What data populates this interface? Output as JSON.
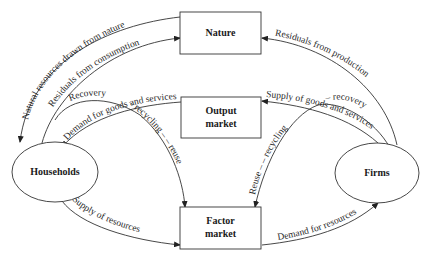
{
  "diagram": {
    "nodes": {
      "nature": {
        "label": "Nature"
      },
      "output_market": {
        "line1": "Output",
        "line2": "market"
      },
      "factor_market": {
        "line1": "Factor",
        "line2": "market"
      },
      "households": {
        "label": "Households"
      },
      "firms": {
        "label": "Firms"
      }
    },
    "flows": {
      "natural_resources": "Natural resources drawn from nature",
      "residuals_consumption": "Residuals from consumption",
      "residuals_production": "Residuals from production",
      "demand_goods": "Demand for goods and services",
      "supply_goods": "Supply of goods and services",
      "recovery_left": "Recovery",
      "recycling_reuse_left": "– recycling – – reuse",
      "recovery_right": "– recovery",
      "reuse_recycling_right": "Reuse – – recycling",
      "supply_resources": "Supply of resources",
      "demand_resources": "Demand for resources"
    }
  }
}
